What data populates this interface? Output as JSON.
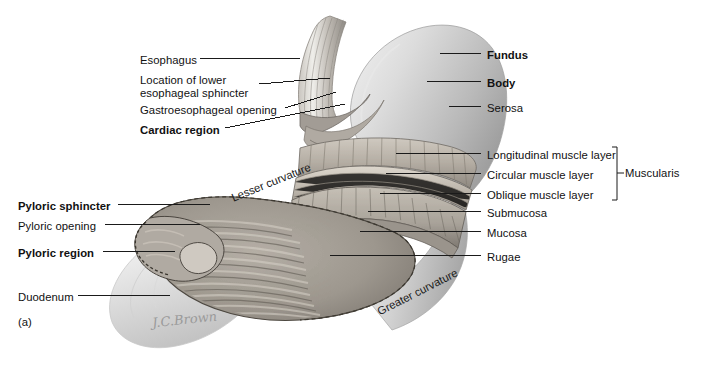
{
  "figure": {
    "panel_letter": "(a)",
    "signature": "J.C.Brown",
    "background_color": "#ffffff",
    "line_color": "#1a1a1a"
  },
  "labels_left": [
    {
      "id": "esophagus",
      "text": "Esophagus",
      "bold": false,
      "x": 140,
      "y": 54,
      "line": [
        200,
        58,
        300,
        58
      ]
    },
    {
      "id": "lower-esoph-sphincter",
      "text": "Location of lower",
      "bold": false,
      "x": 140,
      "y": 74,
      "line": [
        259,
        84,
        330,
        78
      ]
    },
    {
      "id": "lower-esoph-sphincter2",
      "text": "esophageal sphincter",
      "bold": false,
      "x": 140,
      "y": 86,
      "line": null
    },
    {
      "id": "gastroesophageal-opening",
      "text": "Gastroesophageal opening",
      "bold": false,
      "x": 140,
      "y": 104,
      "line": [
        285,
        108,
        336,
        92
      ]
    },
    {
      "id": "cardiac-region",
      "text": "Cardiac region",
      "bold": true,
      "x": 140,
      "y": 124,
      "line": [
        225,
        128,
        345,
        104
      ]
    },
    {
      "id": "pyloric-sphincter",
      "text": "Pyloric sphincter",
      "bold": true,
      "x": 18,
      "y": 200,
      "line": [
        118,
        204,
        210,
        204
      ]
    },
    {
      "id": "pyloric-opening",
      "text": "Pyloric opening",
      "bold": false,
      "x": 18,
      "y": 220,
      "line": [
        105,
        224,
        200,
        224
      ]
    },
    {
      "id": "pyloric-region",
      "text": "Pyloric region",
      "bold": true,
      "x": 18,
      "y": 247,
      "line": [
        103,
        251,
        175,
        251
      ]
    },
    {
      "id": "duodenum",
      "text": "Duodenum",
      "bold": false,
      "x": 18,
      "y": 291,
      "line": [
        78,
        295,
        170,
        295
      ]
    }
  ],
  "labels_right": [
    {
      "id": "fundus",
      "text": "Fundus",
      "bold": true,
      "x": 487,
      "y": 49,
      "line": [
        440,
        53,
        481,
        53
      ]
    },
    {
      "id": "body",
      "text": "Body",
      "bold": true,
      "x": 487,
      "y": 77,
      "line": [
        427,
        81,
        481,
        81
      ]
    },
    {
      "id": "serosa",
      "text": "Serosa",
      "bold": false,
      "x": 487,
      "y": 102,
      "line": [
        449,
        106,
        481,
        106
      ]
    },
    {
      "id": "longitudinal-muscle-layer",
      "text": "Longitudinal muscle layer",
      "bold": false,
      "x": 487,
      "y": 149,
      "line": [
        396,
        153,
        481,
        153
      ]
    },
    {
      "id": "circular-muscle-layer",
      "text": "Circular muscle layer",
      "bold": false,
      "x": 487,
      "y": 169,
      "line": [
        386,
        173,
        481,
        173
      ]
    },
    {
      "id": "oblique-muscle-layer",
      "text": "Oblique muscle layer",
      "bold": false,
      "x": 487,
      "y": 189,
      "line": [
        380,
        193,
        481,
        193
      ]
    },
    {
      "id": "submucosa",
      "text": "Submucosa",
      "bold": false,
      "x": 487,
      "y": 207,
      "line": [
        368,
        211,
        481,
        211
      ]
    },
    {
      "id": "mucosa",
      "text": "Mucosa",
      "bold": false,
      "x": 487,
      "y": 227,
      "line": [
        360,
        231,
        481,
        231
      ]
    },
    {
      "id": "rugae",
      "text": "Rugae",
      "bold": false,
      "x": 487,
      "y": 251,
      "line": [
        330,
        255,
        481,
        255
      ]
    }
  ],
  "bracket": {
    "label": "Muscularis",
    "label_x": 625,
    "label_y": 169,
    "x": 612,
    "y_top": 147,
    "y_bottom": 200,
    "tick_x": 619,
    "tick_y": 173
  },
  "curved_labels": [
    {
      "id": "lesser-curvature",
      "text": "Lesser curvature",
      "x": 232,
      "y": 198,
      "rotate": -22
    },
    {
      "id": "greater-curvature",
      "text": "Greater curvature",
      "x": 378,
      "y": 312,
      "rotate": -27
    }
  ],
  "illustration": {
    "description": "Cut-away anterior view of the human stomach showing esophagus, fundus, body, muscle layers, rugae and duodenum",
    "serosa_fill": "#d6d6d6",
    "muscle_fill": "#b9b4ad",
    "mucosa_fill": "#a9a49d",
    "rugae_fill": "#8f8a83",
    "duodenum_fill": "#dcdcdc"
  }
}
